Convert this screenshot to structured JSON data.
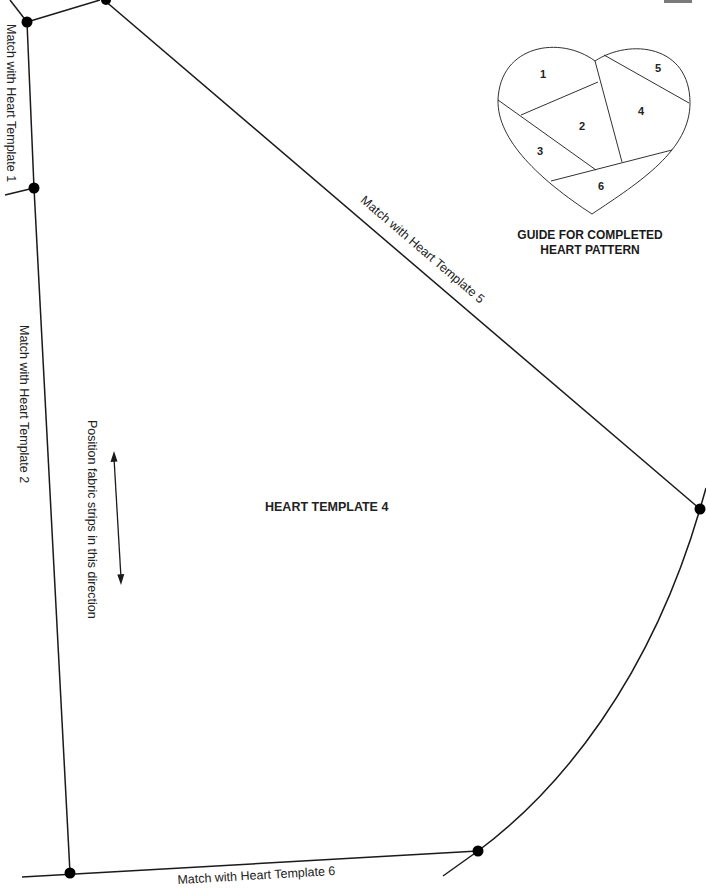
{
  "template": {
    "title": "HEART TEMPLATE 4",
    "edges": {
      "top_left": "Match with Heart Template 1",
      "left": "Match with Heart Template 2",
      "top_right": "Match with Heart Template 5",
      "bottom": "Match with Heart Template 6"
    },
    "direction_note": "Position fabric strips in this direction"
  },
  "guide": {
    "title_line1": "GUIDE FOR COMPLETED",
    "title_line2": "HEART PATTERN",
    "pieces": [
      "1",
      "2",
      "3",
      "4",
      "5",
      "6"
    ]
  },
  "colors": {
    "line": "#1a1a1a",
    "dot": "#000000",
    "tab": "#7a7a7a"
  }
}
